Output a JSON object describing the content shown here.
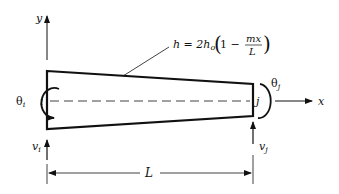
{
  "diagram": {
    "type": "tapered beam element",
    "equation": {
      "lhs": "h = 2h",
      "sub": "o",
      "paren_open": "(",
      "one_minus": "1 −",
      "numerator": "mx",
      "denominator": "L",
      "paren_close": ")"
    },
    "axes": {
      "x_label": "x",
      "y_label": "y"
    },
    "nodes": {
      "i": "i",
      "j": "j"
    },
    "rotations": {
      "theta_i": "θ",
      "theta_i_sub": "i",
      "theta_j": "θ",
      "theta_j_sub": "j"
    },
    "forces": {
      "v_i": "v",
      "v_i_sub": "i",
      "v_j": "v",
      "v_j_sub": "j"
    },
    "dimension": {
      "label": "L"
    }
  }
}
